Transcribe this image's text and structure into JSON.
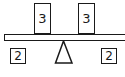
{
  "diagram": {
    "type": "balance-scale",
    "on_beam": [
      {
        "label": "3",
        "position": "left"
      },
      {
        "label": "3",
        "position": "right"
      }
    ],
    "below_beam": [
      {
        "label": "2",
        "position": "left"
      },
      {
        "label": "2",
        "position": "right"
      }
    ]
  }
}
